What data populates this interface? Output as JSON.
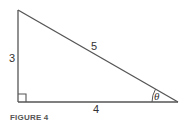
{
  "figure": {
    "caption": "FIGURE 4",
    "type": "right-triangle",
    "line_color": "#555555",
    "sides": {
      "vertical": "3",
      "hypotenuse": "5",
      "horizontal": "4"
    },
    "angle_label": "θ",
    "right_angle_marker": true
  }
}
